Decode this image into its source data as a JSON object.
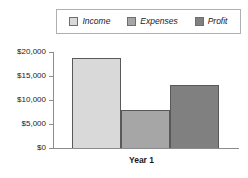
{
  "chart_data": {
    "type": "bar",
    "title": "",
    "subtitle": "",
    "xlabel": "Year 1",
    "ylabel": "",
    "categories": [
      "Year 1"
    ],
    "series": [
      {
        "name": "Income",
        "values": [
          18750
        ],
        "color": "#d9d9d9"
      },
      {
        "name": "Expenses",
        "values": [
          7900
        ],
        "color": "#a6a6a6"
      },
      {
        "name": "Profit",
        "values": [
          13100
        ],
        "color": "#808080"
      }
    ],
    "ylim": [
      0,
      20000
    ],
    "ytick_values": [
      0,
      5000,
      10000,
      15000,
      20000
    ],
    "ytick_labels": [
      "$0",
      "$5,000",
      "$10,000",
      "$15,000",
      "$20,000"
    ],
    "grid": false,
    "legend_position": "top",
    "bar_border_color": "#595959",
    "axis_color": "#8c8c8c",
    "background_color": "#ffffff"
  },
  "legend": {
    "items": [
      {
        "label": "Income",
        "swatch_color": "#d9d9d9"
      },
      {
        "label": "Expenses",
        "swatch_color": "#a6a6a6"
      },
      {
        "label": "Profit",
        "swatch_color": "#808080"
      }
    ]
  },
  "y_axis": {
    "labels": [
      "$20,000",
      "$15,000",
      "$10,000",
      "$5,000",
      "$0"
    ]
  },
  "x_axis": {
    "title": "Year 1"
  }
}
